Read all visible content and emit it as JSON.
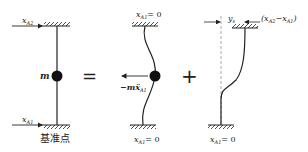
{
  "diagram": {
    "panel1": {
      "top_label": "x",
      "top_sub": "A2",
      "mass_label": "m",
      "bottom_label": "x",
      "bottom_sub": "A1",
      "base_label": "基准点"
    },
    "operator_equals": "=",
    "panel2": {
      "top_label": "x",
      "top_sub": "A1",
      "top_eq": "= 0",
      "force_label": "−mẍ",
      "force_sub": "A1",
      "bottom_label": "x",
      "bottom_sub": "A1",
      "bottom_eq": "= 0"
    },
    "operator_plus": "+",
    "panel3": {
      "disp_label": "y",
      "disp_sub": "s",
      "rel_label_open": "(x",
      "rel_sub1": "A2",
      "rel_minus": "−x",
      "rel_sub2": "A1",
      "rel_close": ")",
      "bottom_label": "x",
      "bottom_sub": "A1",
      "bottom_eq": "= 0"
    }
  }
}
